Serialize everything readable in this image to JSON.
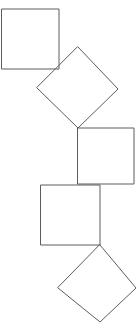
{
  "figure": {
    "background_color": "#ffffff",
    "stroke_color": "#5c5c5c",
    "stroke_width": 1,
    "canvas": {
      "width": 138,
      "height": 327
    },
    "shape_count": 5,
    "shapes": [
      {
        "name": "square-top-left",
        "kind": "square",
        "orientation": "axis-aligned",
        "points": "2,9 59,9 59,69 2,69",
        "center": [
          30.5,
          39
        ],
        "side": 58
      },
      {
        "name": "diamond-upper",
        "kind": "square",
        "orientation": "rotated-45",
        "points": "78,47 118,89 78,128 37,88",
        "center": [
          77.8,
          88
        ],
        "side": 57
      },
      {
        "name": "square-middle-right",
        "kind": "square",
        "orientation": "axis-aligned",
        "points": "78,128 134,128 134,184 78,184",
        "center": [
          106,
          156
        ],
        "side": 56
      },
      {
        "name": "square-middle-left",
        "kind": "square",
        "orientation": "axis-aligned",
        "points": "41,185 100,185 100,245 41,245",
        "center": [
          70.5,
          215
        ],
        "side": 60
      },
      {
        "name": "diamond-lower",
        "kind": "square",
        "orientation": "rotated-45",
        "points": "100,245 136,288 100,322 58,288",
        "center": [
          98.5,
          284
        ],
        "side": 56
      }
    ]
  }
}
